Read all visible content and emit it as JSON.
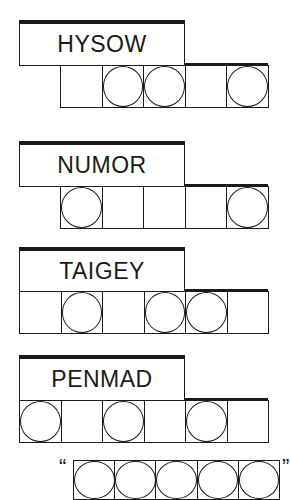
{
  "puzzle": {
    "clues": [
      {
        "scrambled": "HYSOW",
        "label": {
          "x": 19,
          "y": 20,
          "w": 166,
          "h": 46
        },
        "cells_x": 60,
        "cells_y": 65,
        "cell_w": 41.6,
        "cell_h": 43,
        "circles": [
          false,
          true,
          true,
          false,
          true
        ]
      },
      {
        "scrambled": "NUMOR",
        "label": {
          "x": 19,
          "y": 141,
          "w": 166,
          "h": 46
        },
        "cells_x": 60,
        "cells_y": 186,
        "cell_w": 41.6,
        "cell_h": 43,
        "circles": [
          true,
          false,
          false,
          false,
          true
        ]
      },
      {
        "scrambled": "TAIGEY",
        "label": {
          "x": 19,
          "y": 247,
          "w": 166,
          "h": 45
        },
        "cells_x": 19,
        "cells_y": 291,
        "cell_w": 41.5,
        "cell_h": 43,
        "circles": [
          false,
          true,
          false,
          true,
          true,
          false
        ]
      },
      {
        "scrambled": "PENMAD",
        "label": {
          "x": 19,
          "y": 355,
          "w": 166,
          "h": 46
        },
        "cells_x": 19,
        "cells_y": 400,
        "cell_w": 41.5,
        "cell_h": 43,
        "circles": [
          true,
          false,
          true,
          false,
          true,
          false
        ]
      }
    ],
    "answer": {
      "open_quote": "“",
      "close_quote": "”",
      "cells_x": 73,
      "cells_y": 460,
      "cell_w": 41.2,
      "cell_h": 40,
      "circles": [
        true,
        true,
        true,
        true,
        true
      ]
    }
  }
}
